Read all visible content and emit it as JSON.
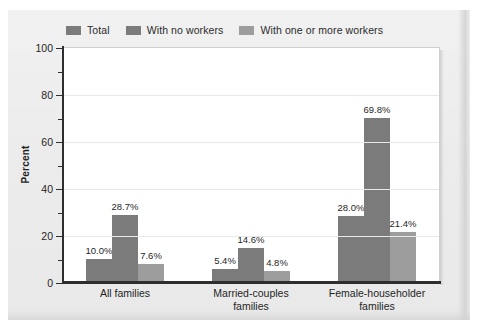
{
  "chart_data": {
    "type": "bar",
    "title": "",
    "xlabel": "",
    "ylabel": "Percent",
    "ylim": [
      0,
      100
    ],
    "ytick_step": 20,
    "yminor_step": 10,
    "grid": true,
    "legend_position": "top-left",
    "categories": [
      "All families",
      "Married-couples families",
      "Female-householder families"
    ],
    "category_lines": [
      [
        "All families"
      ],
      [
        "Married-couples",
        "families"
      ],
      [
        "Female-householder",
        "families"
      ]
    ],
    "yticks": [
      {
        "value": 100,
        "label": "100"
      },
      {
        "value": 90,
        "label": ""
      },
      {
        "value": 80,
        "label": "80"
      },
      {
        "value": 70,
        "label": ""
      },
      {
        "value": 60,
        "label": "60"
      },
      {
        "value": 50,
        "label": ""
      },
      {
        "value": 40,
        "label": "40"
      },
      {
        "value": 30,
        "label": ""
      },
      {
        "value": 20,
        "label": "20"
      },
      {
        "value": 10,
        "label": ""
      },
      {
        "value": 0,
        "label": "0"
      }
    ],
    "series": [
      {
        "name": "Total",
        "color": "#7b7b7b",
        "values": [
          10.0,
          5.4,
          28.0
        ],
        "labels": [
          "10.0%",
          "5.4%",
          "28.0%"
        ]
      },
      {
        "name": "With no workers",
        "color": "#7b7b7b",
        "values": [
          28.7,
          14.6,
          69.8
        ],
        "labels": [
          "28.7%",
          "14.6%",
          "69.8%"
        ]
      },
      {
        "name": "With one or more workers",
        "color": "#9d9d9d",
        "values": [
          7.6,
          4.8,
          21.4
        ],
        "labels": [
          "7.6%",
          "4.8%",
          "21.4%"
        ]
      }
    ]
  },
  "legend": {
    "entries": [
      {
        "label": "Total",
        "color": "#7b7b7b"
      },
      {
        "label": "With no workers",
        "color": "#7b7b7b"
      },
      {
        "label": "With one or more workers",
        "color": "#9d9d9d"
      }
    ]
  },
  "colors": {
    "panel_background": "#eeeeee",
    "plot_background": "#ffffff",
    "axis": "#2e2e2e",
    "gridline": "#e8e8e8",
    "text": "#1f1f1f",
    "series_dark": "#7b7b7b",
    "series_light": "#9d9d9d"
  }
}
